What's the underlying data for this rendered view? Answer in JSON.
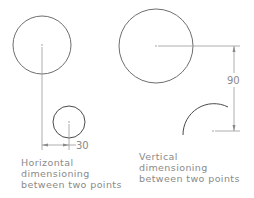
{
  "diagram": {
    "left": {
      "dimension_value": "30",
      "caption": [
        "Horizontal",
        "dimensioning",
        "between two points"
      ]
    },
    "right": {
      "dimension_value": "90",
      "caption": [
        "Vertical",
        "dimensioning",
        "between two points"
      ]
    }
  },
  "colors": {
    "geometry": "#6e6e6e",
    "dimension": "#9a9a9a",
    "text": "#8a8a8a"
  }
}
